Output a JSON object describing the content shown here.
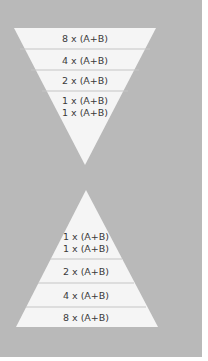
{
  "colors": {
    "background": "#b9b9b9",
    "shape_fill": "#f5f5f5",
    "divider": "#c8c8c8",
    "text": "#3a3a3a"
  },
  "top_funnel": {
    "shape": "inverted-triangle",
    "tiers": [
      {
        "label": "8 x (A+B)"
      },
      {
        "label": "4 x (A+B)"
      },
      {
        "label": "2 x (A+B)"
      },
      {
        "label_line1": "1 x (A+B)",
        "label_line2": "1 x (A+B)"
      }
    ]
  },
  "bottom_pyramid": {
    "shape": "triangle",
    "tiers": [
      {
        "label_line1": "1 x (A+B)",
        "label_line2": "1 x (A+B)"
      },
      {
        "label": "2 x (A+B)"
      },
      {
        "label": "4 x (A+B)"
      },
      {
        "label": "8 x (A+B)"
      }
    ]
  }
}
